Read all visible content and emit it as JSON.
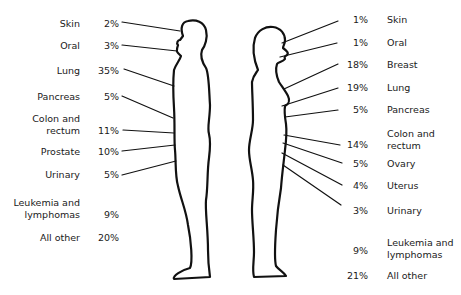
{
  "diagram": {
    "type": "body-silhouette-labeled-percentages",
    "figures": [
      "male-silhouette",
      "female-silhouette"
    ]
  },
  "male": {
    "items": [
      {
        "site": "Skin",
        "pct": "2%"
      },
      {
        "site": "Oral",
        "pct": "3%"
      },
      {
        "site": "Lung",
        "pct": "35%"
      },
      {
        "site": "Pancreas",
        "pct": "5%"
      },
      {
        "site_line1": "Colon and",
        "site_line2": "rectum",
        "pct": "11%"
      },
      {
        "site": "Prostate",
        "pct": "10%"
      },
      {
        "site": "Urinary",
        "pct": "5%"
      },
      {
        "site_line1": "Leukemia and",
        "site_line2": "lymphomas",
        "pct": "9%"
      },
      {
        "site": "All other",
        "pct": "20%"
      }
    ]
  },
  "female": {
    "items": [
      {
        "site": "Skin",
        "pct": "1%"
      },
      {
        "site": "Oral",
        "pct": "1%"
      },
      {
        "site": "Breast",
        "pct": "18%"
      },
      {
        "site": "Lung",
        "pct": "19%"
      },
      {
        "site": "Pancreas",
        "pct": "5%"
      },
      {
        "site_line1": "Colon and",
        "site_line2": "rectum",
        "pct": "14%"
      },
      {
        "site": "Ovary",
        "pct": "5%"
      },
      {
        "site": "Uterus",
        "pct": "4%"
      },
      {
        "site": "Urinary",
        "pct": "3%"
      },
      {
        "site_line1": "Leukemia and",
        "site_line2": "lymphomas",
        "pct": "9%"
      },
      {
        "site": "All other",
        "pct": "21%"
      }
    ]
  }
}
